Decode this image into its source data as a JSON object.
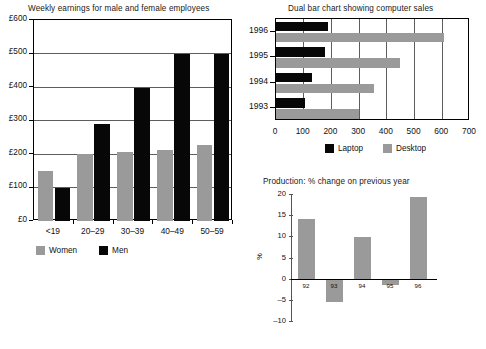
{
  "page": {
    "background": "#ffffff",
    "series_colors": {
      "grey": "#9a9a9a",
      "black": "#070707"
    }
  },
  "chart_data": [
    {
      "id": "weekly-earnings",
      "type": "bar",
      "title": "Weekly earnings for male and female employees",
      "xlabel": "",
      "ylabel": "",
      "categories": [
        "<19",
        "20–29",
        "30–39",
        "40–49",
        "50–59"
      ],
      "ytick_labels": [
        "£0",
        "£100",
        "£200",
        "£300",
        "£400",
        "£500",
        "£600"
      ],
      "ytick_values": [
        0,
        100,
        200,
        300,
        400,
        500,
        600
      ],
      "ylim": [
        0,
        600
      ],
      "grid": true,
      "legend_position": "bottom-left",
      "series": [
        {
          "name": "Women",
          "color": "#9a9a9a",
          "values": [
            150,
            199,
            205,
            212,
            228
          ]
        },
        {
          "name": "Men",
          "color": "#070707",
          "values": [
            100,
            291,
            398,
            499,
            499
          ]
        }
      ]
    },
    {
      "id": "computer-sales",
      "type": "bar",
      "orientation": "horizontal",
      "title": "Dual bar chart showing computer sales",
      "xlabel": "",
      "ylabel": "",
      "categories": [
        "1993",
        "1994",
        "1995",
        "1996"
      ],
      "xtick_labels": [
        "0",
        "100",
        "200",
        "300",
        "400",
        "500",
        "600",
        "700"
      ],
      "xtick_values": [
        0,
        100,
        200,
        300,
        400,
        500,
        600,
        700
      ],
      "xlim": [
        0,
        700
      ],
      "grid": true,
      "legend_position": "bottom-center",
      "series": [
        {
          "name": "Laptop",
          "color": "#070707",
          "values": [
            105,
            130,
            175,
            186
          ]
        },
        {
          "name": "Desktop",
          "color": "#9a9a9a",
          "values": [
            300,
            352,
            449,
            606
          ]
        }
      ]
    },
    {
      "id": "production-change",
      "type": "bar",
      "title": "Production: % change on previous year",
      "xlabel": "",
      "ylabel": "%",
      "categories": [
        "92",
        "93",
        "94",
        "95",
        "96"
      ],
      "ytick_labels": [
        "20",
        "15",
        "10",
        "5",
        "0",
        "–5",
        "–10"
      ],
      "ytick_values": [
        20,
        15,
        10,
        5,
        0,
        -5,
        -10
      ],
      "ylim": [
        -10,
        20
      ],
      "grid": false,
      "legend_position": "none",
      "series": [
        {
          "name": "% change",
          "color": "#9a9a9a",
          "values": [
            14.1,
            -5.6,
            9.9,
            -1.6,
            19.4
          ]
        }
      ]
    }
  ]
}
